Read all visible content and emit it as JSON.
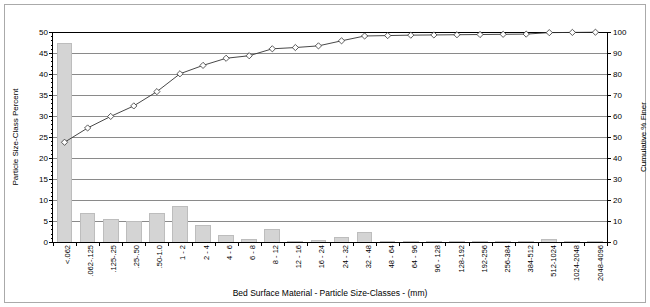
{
  "chart_data": {
    "type": "bar",
    "title": "",
    "xlabel": "Bed Surface Material  -  Particle Size-Classes  - (mm)",
    "ylabel": "Particle Size-Class Percent",
    "y2label": "Cumulative % Finer",
    "grid": true,
    "legend": "none",
    "ylim": [
      0,
      50
    ],
    "y2lim": [
      0,
      100
    ],
    "yticks": [
      0,
      5,
      10,
      15,
      20,
      25,
      30,
      35,
      40,
      45,
      50
    ],
    "y2ticks": [
      0,
      10,
      20,
      30,
      40,
      50,
      60,
      70,
      80,
      90,
      100
    ],
    "categories": [
      "<.062",
      ".062-.125",
      ".125-.25",
      ".25-.50",
      ".50-1.0",
      "1 - 2",
      "2 - 4",
      "4 - 6",
      "6 - 8",
      "8 - 12",
      "12 - 16",
      "16 - 24",
      "24 - 32",
      "32 - 48",
      "48 - 64",
      "64 - 96",
      "96 - 128",
      "128-192",
      "192-256",
      "256-384",
      "384-512",
      "512-1024",
      "1024-2048",
      "2048-4096"
    ],
    "series": [
      {
        "name": "Particle Size-Class Percent",
        "type": "bar",
        "axis": "left",
        "color": "#d4d4d4",
        "values": [
          47.5,
          6.8,
          5.5,
          5.0,
          6.8,
          8.5,
          4.0,
          1.7,
          0.6,
          3.2,
          0.3,
          0.4,
          1.2,
          2.3,
          0.1,
          0.1,
          0.05,
          0.05,
          0.05,
          0.05,
          0.05,
          0.7,
          0.05,
          0.05
        ]
      },
      {
        "name": "Cumulative % Finer",
        "type": "line",
        "axis": "right",
        "marker": "diamond",
        "color": "#333333",
        "values": [
          47.5,
          54.3,
          59.8,
          64.8,
          71.6,
          80.1,
          84.1,
          87.5,
          88.7,
          92.0,
          92.6,
          93.4,
          95.8,
          98.1,
          98.3,
          98.5,
          98.6,
          98.7,
          98.8,
          98.9,
          99.0,
          99.7,
          99.8,
          99.9
        ]
      }
    ]
  }
}
